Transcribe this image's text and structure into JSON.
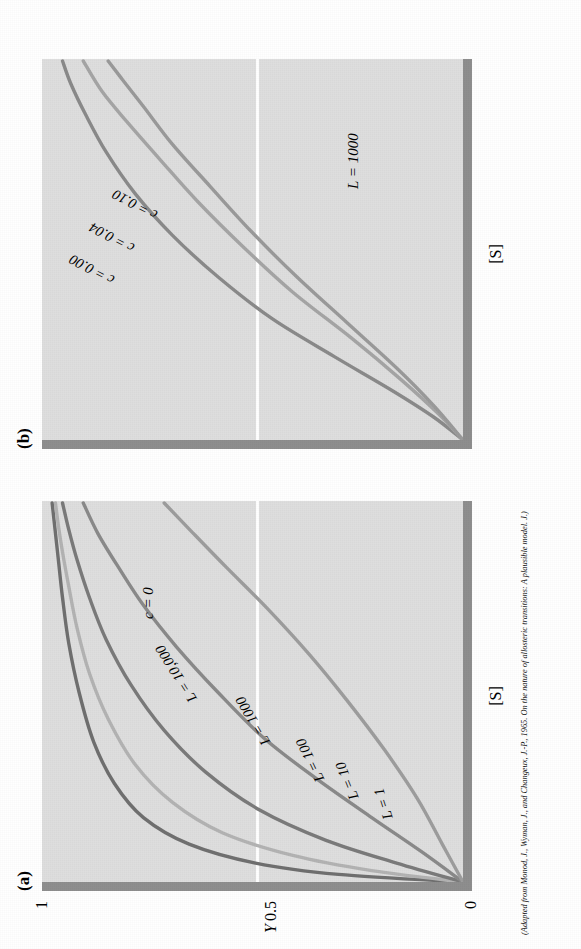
{
  "figure": {
    "panel_a_letter": "(a)",
    "panel_b_letter": "(b)",
    "caption": "(Adapted from Monod, J., Wyman, J., and Changeux, J.-P., 1965. On the nature of allosteric transitions: A plausible model. J.)"
  },
  "axes": {
    "y_label": "Y",
    "y_tick_top": "1",
    "y_tick_mid": "0.5",
    "y_tick_bottom": "0",
    "x_label_a": "[S]",
    "x_label_b": "[S]"
  },
  "colors": {
    "plot_background": "#dedede",
    "axis_rail": "#8e8e8e",
    "gridline": "#ffffff",
    "curve_dark": "#6f6f6f",
    "curve_mid": "#8a8a8a",
    "curve_light": "#b3b3b3",
    "text": "#000000"
  },
  "chart_data": [
    {
      "type": "line",
      "title": "(a)",
      "xlabel": "[S]",
      "ylabel": "Y",
      "ylim": [
        0,
        1
      ],
      "yticks": [
        "0",
        "0.5",
        "1"
      ],
      "grid": "horizontal-at-0.5",
      "annotation": "c = 0",
      "legend_position": "inline-on-curves",
      "series": [
        {
          "name": "L = 1",
          "label": "L = 1",
          "color": "#6f6f6f",
          "x": [
            0,
            0.02,
            0.05,
            0.1,
            0.17,
            0.26,
            0.37,
            0.5,
            0.63,
            0.75,
            0.85,
            0.92,
            1.0
          ],
          "values": [
            0,
            0.3,
            0.5,
            0.66,
            0.77,
            0.84,
            0.89,
            0.925,
            0.95,
            0.965,
            0.975,
            0.982,
            0.99
          ]
        },
        {
          "name": "L = 10",
          "label": "L = 10",
          "color": "#b3b3b3",
          "x": [
            0,
            0.03,
            0.07,
            0.13,
            0.21,
            0.31,
            0.43,
            0.55,
            0.67,
            0.78,
            0.87,
            0.94,
            1.0
          ],
          "values": [
            0,
            0.22,
            0.41,
            0.58,
            0.7,
            0.79,
            0.855,
            0.9,
            0.93,
            0.95,
            0.965,
            0.975,
            0.982
          ]
        },
        {
          "name": "L = 100",
          "label": "L = 100",
          "color": "#7a7a7a",
          "x": [
            0,
            0.05,
            0.11,
            0.19,
            0.29,
            0.4,
            0.52,
            0.64,
            0.75,
            0.85,
            0.93,
            1.0
          ],
          "values": [
            0,
            0.16,
            0.33,
            0.49,
            0.62,
            0.72,
            0.8,
            0.86,
            0.9,
            0.93,
            0.95,
            0.965
          ]
        },
        {
          "name": "L = 1000",
          "label": "L = 1000",
          "color": "#8a8a8a",
          "x": [
            0,
            0.08,
            0.17,
            0.27,
            0.38,
            0.5,
            0.62,
            0.73,
            0.83,
            0.92,
            1.0
          ],
          "values": [
            0,
            0.1,
            0.22,
            0.35,
            0.48,
            0.59,
            0.69,
            0.77,
            0.83,
            0.88,
            0.915
          ]
        },
        {
          "name": "L = 10,000",
          "label": "L = 10,000",
          "color": "#9d9d9d",
          "x": [
            0,
            0.1,
            0.22,
            0.35,
            0.48,
            0.6,
            0.72,
            0.83,
            0.92,
            1.0
          ],
          "values": [
            0,
            0.05,
            0.11,
            0.19,
            0.28,
            0.37,
            0.47,
            0.57,
            0.65,
            0.72
          ]
        }
      ]
    },
    {
      "type": "line",
      "title": "(b)",
      "xlabel": "[S]",
      "ylabel": "Y",
      "ylim": [
        0,
        1
      ],
      "grid": "horizontal-at-0.5",
      "annotation": "L = 1000",
      "legend_position": "inline-on-curves",
      "series": [
        {
          "name": "c = 0.00",
          "label": "c = 0.00",
          "color": "#8a8a8a",
          "x": [
            0,
            0.06,
            0.13,
            0.22,
            0.32,
            0.43,
            0.54,
            0.65,
            0.76,
            0.86,
            0.94,
            1.0
          ],
          "values": [
            0,
            0.07,
            0.17,
            0.31,
            0.46,
            0.59,
            0.7,
            0.79,
            0.86,
            0.91,
            0.945,
            0.965
          ]
        },
        {
          "name": "c = 0.04",
          "label": "c = 0.04",
          "color": "#a5a5a5",
          "x": [
            0,
            0.07,
            0.16,
            0.27,
            0.39,
            0.51,
            0.63,
            0.74,
            0.84,
            0.92,
            1.0
          ],
          "values": [
            0,
            0.06,
            0.15,
            0.27,
            0.41,
            0.53,
            0.64,
            0.73,
            0.81,
            0.87,
            0.915
          ]
        },
        {
          "name": "c = 0.10",
          "label": "c = 0.10",
          "color": "#9a9a9a",
          "x": [
            0,
            0.09,
            0.19,
            0.31,
            0.43,
            0.55,
            0.67,
            0.78,
            0.88,
            0.95,
            1.0
          ],
          "values": [
            0,
            0.07,
            0.16,
            0.28,
            0.4,
            0.51,
            0.61,
            0.7,
            0.77,
            0.82,
            0.855
          ]
        }
      ]
    }
  ],
  "annotations": {
    "panel_a_c": "c = 0",
    "panel_b_L": "L = 1000",
    "panel_a_curve_labels": [
      "L = 1",
      "L = 10",
      "L = 100",
      "L = 1000",
      "L = 10,000"
    ],
    "panel_b_curve_labels": [
      "c = 0.00",
      "c = 0.04",
      "c = 0.10"
    ]
  }
}
